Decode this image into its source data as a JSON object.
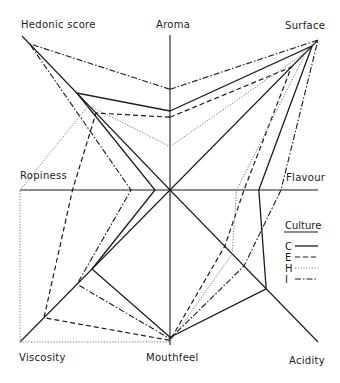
{
  "chart_data": {
    "type": "radar",
    "title": "",
    "axes": [
      "Aroma",
      "Surface",
      "Flavour",
      "Acidity",
      "Mouthfeel",
      "Viscosity",
      "Ropiness",
      "Hedonic score"
    ],
    "scale": [
      0,
      1
    ],
    "series": [
      {
        "name": "C",
        "style": "solid",
        "values": [
          0.51,
          0.96,
          0.6,
          0.65,
          0.95,
          0.52,
          0.1,
          0.63
        ]
      },
      {
        "name": "E",
        "style": "dashed",
        "values": [
          0.47,
          0.82,
          0.5,
          0.37,
          0.97,
          0.84,
          0.65,
          0.5
        ]
      },
      {
        "name": "H",
        "style": "dotted",
        "values": [
          0.28,
          0.92,
          0.45,
          0.42,
          0.98,
          1.0,
          1.0,
          0.55
        ]
      },
      {
        "name": "I",
        "style": "dash-dot",
        "values": [
          0.65,
          1.0,
          0.75,
          0.5,
          0.96,
          0.62,
          0.26,
          0.95
        ]
      }
    ],
    "legend": {
      "title": "Culture",
      "position": "right",
      "entries": [
        "C",
        "E",
        "H",
        "I"
      ]
    },
    "grid": false
  },
  "labels": {
    "aroma": "Aroma",
    "surface": "Surface",
    "flavour": "Flavour",
    "acidity": "Acidity",
    "mouthfeel": "Mouthfeel",
    "viscosity": "Viscosity",
    "ropiness": "Ropiness",
    "hedonic": "Hedonic score"
  },
  "legend": {
    "title": "Culture",
    "items": [
      {
        "key": "C",
        "style": "solid"
      },
      {
        "key": "E",
        "style": "dashed"
      },
      {
        "key": "H",
        "style": "dotted"
      },
      {
        "key": "I",
        "style": "dash-dot"
      }
    ]
  }
}
